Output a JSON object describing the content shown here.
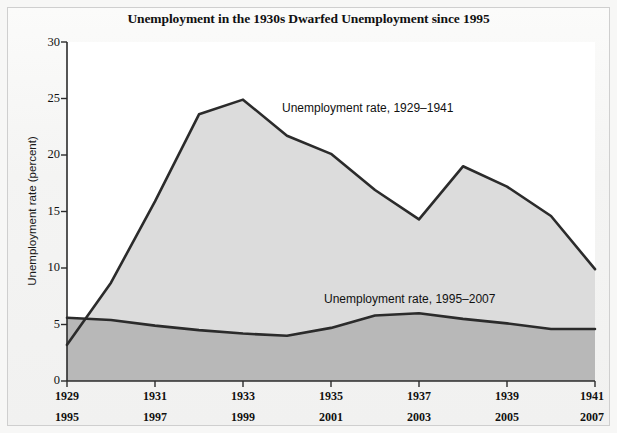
{
  "figure": {
    "title": "Unemployment in the 1930s Dwarfed Unemployment since 1995",
    "ylabel": "Unemployment rate (percent)"
  },
  "axis": {
    "y_ticks": [
      "0",
      "5",
      "10",
      "15",
      "20",
      "25",
      "30"
    ],
    "x_ticks_top": [
      "1929",
      "1931",
      "1933",
      "1935",
      "1937",
      "1939",
      "1941"
    ],
    "x_ticks_bottom": [
      "1995",
      "1997",
      "1999",
      "2001",
      "2003",
      "2005",
      "2007"
    ]
  },
  "annotations": {
    "series_a_label": "Unemployment rate, 1929–1941",
    "series_b_label": "Unemployment rate, 1995–2007"
  },
  "colors": {
    "line": "#2b2b2b",
    "fill_upper": "#dcdcdc",
    "fill_lower": "#b8b8b8",
    "plot_background": "#ffffff",
    "page_background": "#f2f2f1",
    "frame_border": "#cfcfcf"
  },
  "chart_data": {
    "type": "area",
    "title": "Unemployment in the 1930s Dwarfed Unemployment since 1995",
    "xlabel": "",
    "ylabel": "Unemployment rate (percent)",
    "ylim": [
      0,
      30
    ],
    "grid": false,
    "legend": "inline-annotations",
    "x_axis_primary": {
      "name": "Year (1929–1941)",
      "values": [
        1929,
        1930,
        1931,
        1932,
        1933,
        1934,
        1935,
        1936,
        1937,
        1938,
        1939,
        1940,
        1941
      ],
      "ticks": [
        1929,
        1931,
        1933,
        1935,
        1937,
        1939,
        1941
      ]
    },
    "x_axis_secondary": {
      "name": "Year (1995–2007)",
      "values": [
        1995,
        1996,
        1997,
        1998,
        1999,
        2000,
        2001,
        2002,
        2003,
        2004,
        2005,
        2006,
        2007
      ],
      "ticks": [
        1995,
        1997,
        1999,
        2001,
        2003,
        2005,
        2007
      ]
    },
    "series": [
      {
        "name": "Unemployment rate, 1929–1941",
        "x": [
          1929,
          1930,
          1931,
          1932,
          1933,
          1934,
          1935,
          1936,
          1937,
          1938,
          1939,
          1940,
          1941
        ],
        "values": [
          3.2,
          8.7,
          15.9,
          23.6,
          24.9,
          21.7,
          20.1,
          16.9,
          14.3,
          19.0,
          17.2,
          14.6,
          9.9
        ],
        "fill": "#dcdcdc"
      },
      {
        "name": "Unemployment rate, 1995–2007",
        "x": [
          1995,
          1996,
          1997,
          1998,
          1999,
          2000,
          2001,
          2002,
          2003,
          2004,
          2005,
          2006,
          2007
        ],
        "values": [
          5.6,
          5.4,
          4.9,
          4.5,
          4.2,
          4.0,
          4.7,
          5.8,
          6.0,
          5.5,
          5.1,
          4.6,
          4.6
        ],
        "fill": "#b8b8b8"
      }
    ]
  }
}
